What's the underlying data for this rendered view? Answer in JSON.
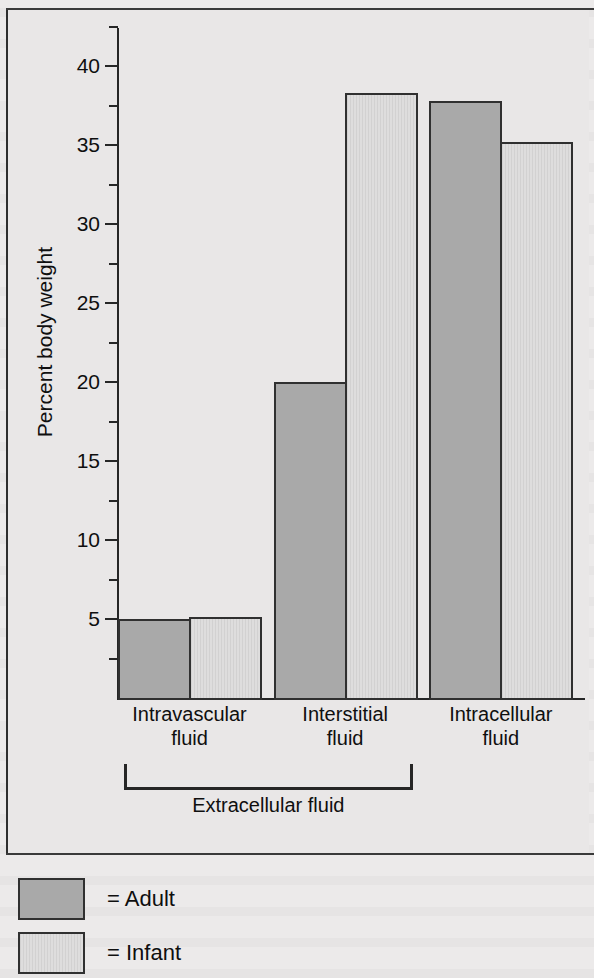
{
  "chart_data": {
    "type": "bar",
    "title": "",
    "xlabel": "",
    "ylabel": "Percent body weight",
    "ylim": [
      0,
      42
    ],
    "ytick_labels": [
      "5",
      "10",
      "15",
      "20",
      "25",
      "30",
      "35",
      "40"
    ],
    "ytick_values": [
      5,
      10,
      15,
      20,
      25,
      30,
      35,
      40
    ],
    "ytick_minor_values": [
      2.5,
      7.5,
      12.5,
      17.5,
      22.5,
      27.5,
      32.5,
      37.5,
      42.5
    ],
    "grid": false,
    "legend_position": "below-figure",
    "categories": [
      "Intravascular\nfluid",
      "Interstitial\nfluid",
      "Intracellular\nfluid"
    ],
    "category_lines": [
      [
        "Intravascular",
        "fluid"
      ],
      [
        "Interstitial",
        "fluid"
      ],
      [
        "Intracellular",
        "fluid"
      ]
    ],
    "series": [
      {
        "name": "Adult",
        "color": "#a9a9a9",
        "values": [
          5.0,
          20.0,
          37.8
        ]
      },
      {
        "name": "Infant",
        "color": "#dedddd",
        "values": [
          5.1,
          38.3,
          35.2
        ]
      }
    ],
    "annotations": [
      {
        "name": "extracellular-bracket",
        "label": "Extracellular fluid",
        "spans_categories": [
          "Intravascular fluid",
          "Interstitial fluid"
        ]
      }
    ]
  },
  "legend": {
    "items": [
      {
        "equals": "=",
        "label": "Adult"
      },
      {
        "equals": "=",
        "label": "Infant"
      }
    ]
  },
  "colors": {
    "adult_fill": "#a9a9a9",
    "infant_fill": "#dedddd",
    "bar_stroke": "#303030",
    "axis": "#262626",
    "page_background": "#e9e7e7",
    "text": "#0f0f0f"
  }
}
